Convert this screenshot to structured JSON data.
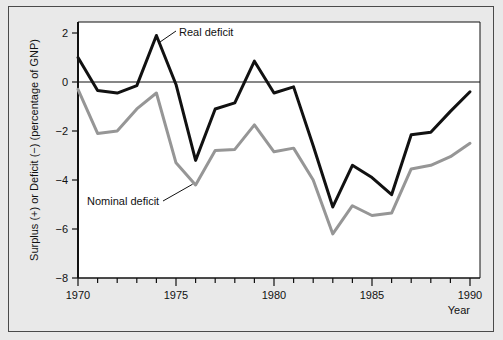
{
  "figure": {
    "background_color": "#e9e9e9",
    "plot_background_color": "#ffffff",
    "border_color": "#4a4a4a"
  },
  "chart_data": {
    "type": "line",
    "title": "",
    "subtitle": "",
    "xlabel": "Year",
    "ylabel": "Surplus (+) or Deficit (−) (percentage of GNP)",
    "xlim": [
      1970,
      1990
    ],
    "ylim": [
      -8,
      2
    ],
    "yticks": [
      2,
      0,
      -2,
      -4,
      -6,
      -8
    ],
    "ytick_labels": [
      "2",
      "0",
      "−2",
      "−4",
      "−6",
      "−8"
    ],
    "xticks": [
      1970,
      1971,
      1972,
      1973,
      1974,
      1975,
      1976,
      1977,
      1978,
      1979,
      1980,
      1981,
      1982,
      1983,
      1984,
      1985,
      1986,
      1987,
      1988,
      1989,
      1990
    ],
    "xtick_labels_shown": [
      1970,
      1975,
      1980,
      1985,
      1990
    ],
    "grid": false,
    "legend_position": "inline-annotations",
    "zero_line": 0,
    "x": [
      1970,
      1971,
      1972,
      1973,
      1974,
      1975,
      1976,
      1977,
      1978,
      1979,
      1980,
      1981,
      1982,
      1983,
      1984,
      1985,
      1986,
      1987,
      1988,
      1989,
      1990
    ],
    "series": [
      {
        "name": "Real deficit",
        "color": "#111111",
        "line_width": 3.0,
        "values": [
          1.0,
          -0.35,
          -0.45,
          -0.15,
          1.9,
          -0.1,
          -3.2,
          -1.1,
          -0.85,
          0.85,
          -0.45,
          -0.2,
          -2.6,
          -5.1,
          -3.4,
          -3.9,
          -4.6,
          -2.15,
          -2.05,
          -1.2,
          -0.4
        ],
        "annotation": {
          "text": "Real deficit",
          "points_to_year": 1974,
          "points_to_value": 1.75
        }
      },
      {
        "name": "Nominal deficit",
        "color": "#969696",
        "line_width": 3.0,
        "values": [
          -0.3,
          -2.1,
          -2.0,
          -1.1,
          -0.45,
          -3.3,
          -4.2,
          -2.8,
          -2.75,
          -1.75,
          -2.85,
          -2.7,
          -4.0,
          -6.2,
          -5.05,
          -5.45,
          -5.35,
          -3.55,
          -3.4,
          -3.05,
          -2.5
        ],
        "annotation": {
          "text": "Nominal deficit",
          "points_to_year": 1976,
          "points_to_value": -4.05
        }
      }
    ]
  },
  "labels": {
    "real_deficit": "Real deficit",
    "nominal_deficit": "Nominal deficit",
    "year_axis": "Year",
    "y_axis": "Surplus (+) or Deficit (−) (percentage of GNP)"
  }
}
